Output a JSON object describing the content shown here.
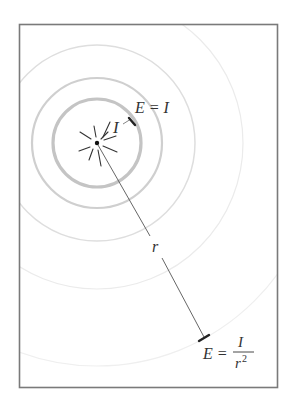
{
  "diagram": {
    "frame": {
      "x": 19,
      "y": 24,
      "width": 259,
      "height": 364,
      "stroke": "#7a7a7a"
    },
    "source": {
      "x": 97,
      "y": 143,
      "label": "I",
      "color": "#111111"
    },
    "rings": [
      {
        "r": 44,
        "stroke": "#c4c4c4",
        "width": 3.2
      },
      {
        "r": 65,
        "stroke": "#cfcfcf",
        "width": 2.2
      },
      {
        "r": 98,
        "stroke": "#dedede",
        "width": 1.5
      },
      {
        "r": 146,
        "stroke": "#ebebeb",
        "width": 1.2
      },
      {
        "r": 223,
        "stroke": "#efefef",
        "width": 1.2
      }
    ],
    "near_label": {
      "text": "E = I"
    },
    "distance_label": {
      "text": "r"
    },
    "far_label": {
      "lhs": "E =",
      "numerator": "I",
      "denominator": "r",
      "exponent": "2"
    },
    "colors": {
      "ink": "#333333",
      "line": "#555555",
      "tick": "#222222"
    }
  }
}
